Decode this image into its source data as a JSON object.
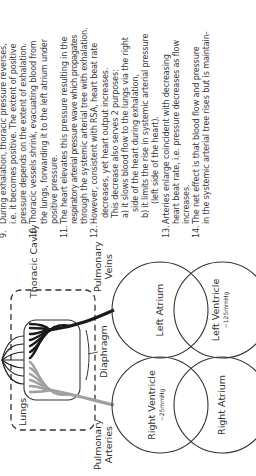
{
  "diagram": {
    "labels": {
      "thoracic_cavity": "Thoracic Cavity",
      "lungs": "Lungs",
      "diaphragm": "Diaphragm",
      "pulmonary_veins": [
        "Pulmonary",
        "Veins"
      ],
      "pulmonary_arteries": [
        "Pulmonary",
        "Arteries"
      ]
    },
    "chambers": [
      {
        "name": "Left Atrium",
        "pressure": ""
      },
      {
        "name": "Left Ventricle",
        "pressure": "~125mmHg"
      },
      {
        "name": "Right Ventricle",
        "pressure": "~25mmHg"
      },
      {
        "name": "Right Atrium",
        "pressure": ""
      }
    ],
    "colors": {
      "veins": "#1a1a1a",
      "arteries": "#a0a0a0",
      "outline": "#333333"
    }
  },
  "steps": [
    {
      "num": "9.",
      "lines": [
        "During exhalation, thoracic pressure reverses,",
        "i.e. it becomes positive.  The extent of positive",
        "pressure depends on the extent of exhalation."
      ]
    },
    {
      "num": "10.",
      "lines": [
        "Thoracic vessels shrink, evacuating blood from",
        "the lungs, forwarding it to the left atrium under",
        "positive pressure."
      ]
    },
    {
      "num": "11.",
      "lines": [
        "The heart elevates this pressure resulting in the",
        "respiratory arterial pressure wave which propagates",
        "through the systemic arterial tree with exhalation."
      ]
    },
    {
      "num": "12.",
      "lines": [
        "However, consistent with RSA, heart beat rate",
        "decreases, yet heart output increases.",
        "This decrease also serves 2 purposes:"
      ],
      "subs": [
        {
          "lines": [
            "a) it slows blood flow to the lungs via the right",
            "side of the heart during exhalation,"
          ]
        },
        {
          "lines": [
            "b) it limits the rise in systemic arterial pressure",
            "(left side of the heart)."
          ]
        }
      ]
    },
    {
      "num": "13.",
      "lines": [
        "Arteries enlarge coincident with decreasing",
        "heart beat rate, i.e. pressure decreases as flow",
        "increases."
      ]
    },
    {
      "num": "14.",
      "lines": [
        "The net effect is that blood flow and pressure",
        "in the systemic arterial tree rises but is maintain-"
      ]
    }
  ]
}
